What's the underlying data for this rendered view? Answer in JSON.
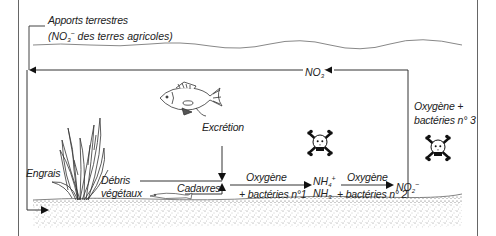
{
  "diagram": {
    "colors": {
      "line": "#222222",
      "frame": "#555555",
      "sediment": "#9a9a9a",
      "background": "#ffffff"
    },
    "labels": {
      "inputs_line1": "Apports terrestres",
      "inputs_line2_prefix": "(NO",
      "inputs_line2_sub": "3",
      "inputs_line2_sup": "−",
      "inputs_line2_suffix": " des terres agricoles)",
      "excretion": "Excrétion",
      "fertilizer": "Engrais",
      "plant_debris_1": "Débris",
      "plant_debris_2": "végétaux",
      "carcasses": "Cadavres",
      "step1_top": "Oxygène",
      "step1_bottom": "+ bactéries n°1",
      "step2_top": "Oxygène",
      "step2_bottom": "+ bactéries n° 2",
      "step3_line1": "Oxygène +",
      "step3_line2": "bactéries n° 3"
    },
    "chemicals": {
      "ammonium": {
        "base": "NH",
        "sub": "4",
        "sup": "+"
      },
      "ammonia": {
        "base": "NH",
        "sub": "3"
      },
      "nitrite": {
        "base": "NO",
        "sub": "2",
        "sup": "−"
      },
      "nitrate": {
        "base": "NO",
        "sub": "3",
        "sup": "−"
      }
    },
    "icons": [
      "fish-icon",
      "aquatic-plant-icon",
      "skull-crossbones-icon",
      "skull-crossbones-icon",
      "dead-fish-icon",
      "sediment-layer"
    ]
  }
}
